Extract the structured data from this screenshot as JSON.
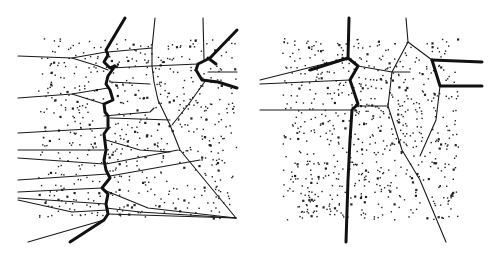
{
  "figure": {
    "width": 499,
    "height": 258,
    "background": "#ffffff",
    "ink_color": "#1a1a1a",
    "panels": [
      {
        "id": "left",
        "point_cloud": {
          "x": [
            38,
            236
          ],
          "y": [
            38,
            218
          ],
          "count": 620,
          "seed": 11
        },
        "bold_paths": [
          [
            [
              125,
              18
            ],
            [
              106,
              50
            ],
            [
              108,
              55
            ],
            [
              104,
              62
            ],
            [
              110,
              68
            ],
            [
              115,
              66
            ],
            [
              108,
              76
            ],
            [
              106,
              84
            ],
            [
              110,
              90
            ],
            [
              113,
              100
            ],
            [
              104,
              104
            ],
            [
              105,
              112
            ],
            [
              108,
              116
            ],
            [
              108,
              128
            ],
            [
              104,
              134
            ],
            [
              106,
              150
            ],
            [
              104,
              160
            ],
            [
              106,
              170
            ],
            [
              110,
              178
            ],
            [
              102,
              188
            ],
            [
              108,
              194
            ],
            [
              106,
              204
            ],
            [
              108,
              214
            ],
            [
              104,
              220
            ],
            [
              70,
              242
            ]
          ],
          [
            [
              237,
              30
            ],
            [
              210,
              58
            ],
            [
              198,
              64
            ],
            [
              196,
              70
            ],
            [
              202,
              80
            ],
            [
              218,
              82
            ],
            [
              237,
              88
            ]
          ],
          [
            [
              208,
              58
            ],
            [
              216,
              64
            ]
          ]
        ],
        "thin_paths": [
          [
            [
              18,
              56
            ],
            [
              72,
              58
            ],
            [
              106,
              52
            ]
          ],
          [
            [
              72,
              58
            ],
            [
              98,
              66
            ],
            [
              108,
              70
            ]
          ],
          [
            [
              108,
              52
            ],
            [
              152,
              48
            ]
          ],
          [
            [
              110,
              68
            ],
            [
              152,
              66
            ],
            [
              198,
              64
            ]
          ],
          [
            [
              155,
              18
            ],
            [
              152,
              48
            ],
            [
              152,
              66
            ],
            [
              154,
              82
            ],
            [
              158,
              100
            ],
            [
              170,
              125
            ],
            [
              180,
              150
            ],
            [
              236,
              218
            ]
          ],
          [
            [
              110,
              82
            ],
            [
              150,
              84
            ]
          ],
          [
            [
              18,
              98
            ],
            [
              72,
              94
            ],
            [
              108,
              88
            ]
          ],
          [
            [
              72,
              94
            ],
            [
              104,
              104
            ]
          ],
          [
            [
              104,
              116
            ],
            [
              150,
              112
            ],
            [
              154,
              108
            ]
          ],
          [
            [
              203,
              18
            ],
            [
              204,
              60
            ]
          ],
          [
            [
              206,
              80
            ],
            [
              188,
              105
            ],
            [
              172,
              125
            ]
          ],
          [
            [
              208,
              72
            ],
            [
              237,
              72
            ]
          ],
          [
            [
              18,
              133
            ],
            [
              106,
              128
            ]
          ],
          [
            [
              110,
              118
            ],
            [
              170,
              120
            ]
          ],
          [
            [
              106,
              140
            ],
            [
              140,
              150
            ],
            [
              170,
              152
            ]
          ],
          [
            [
              18,
              150
            ],
            [
              104,
              150
            ]
          ],
          [
            [
              18,
              158
            ],
            [
              104,
              164
            ]
          ],
          [
            [
              106,
              164
            ],
            [
              178,
              150
            ]
          ],
          [
            [
              18,
              180
            ],
            [
              108,
              174
            ]
          ],
          [
            [
              110,
              176
            ],
            [
              200,
              160
            ]
          ],
          [
            [
              18,
              192
            ],
            [
              102,
              188
            ]
          ],
          [
            [
              18,
              198
            ],
            [
              106,
              204
            ]
          ],
          [
            [
              104,
              190
            ],
            [
              148,
              208
            ],
            [
              236,
              218
            ]
          ],
          [
            [
              108,
              214
            ],
            [
              236,
              218
            ]
          ],
          [
            [
              106,
              208
            ],
            [
              140,
              212
            ],
            [
              236,
              218
            ]
          ],
          [
            [
              104,
              220
            ],
            [
              28,
              242
            ]
          ],
          [
            [
              108,
              210
            ],
            [
              72,
              212
            ],
            [
              18,
              200
            ]
          ]
        ]
      },
      {
        "id": "right",
        "point_cloud": {
          "x": [
            282,
            458
          ],
          "y": [
            38,
            220
          ],
          "count": 700,
          "seed": 29
        },
        "bold_paths": [
          [
            [
              349,
              18
            ],
            [
              348,
              58
            ],
            [
              358,
              66
            ],
            [
              350,
              80
            ],
            [
              358,
              104
            ],
            [
              352,
              110
            ],
            [
              350,
              140
            ],
            [
              348,
              180
            ],
            [
              346,
              242
            ]
          ],
          [
            [
              348,
              58
            ],
            [
              310,
              70
            ]
          ],
          [
            [
              432,
              60
            ],
            [
              440,
              86
            ],
            [
              482,
              86
            ]
          ],
          [
            [
              432,
              60
            ],
            [
              482,
              62
            ]
          ]
        ],
        "thin_paths": [
          [
            [
              260,
              80
            ],
            [
              348,
              58
            ]
          ],
          [
            [
              260,
              84
            ],
            [
              350,
              80
            ]
          ],
          [
            [
              260,
              110
            ],
            [
              352,
              110
            ]
          ],
          [
            [
              358,
              66
            ],
            [
              392,
              72
            ],
            [
              410,
              72
            ]
          ],
          [
            [
              406,
              18
            ],
            [
              408,
              42
            ],
            [
              392,
              72
            ],
            [
              388,
              106
            ],
            [
              402,
              150
            ],
            [
              420,
              180
            ],
            [
              446,
              242
            ]
          ],
          [
            [
              408,
              42
            ],
            [
              432,
              60
            ]
          ],
          [
            [
              440,
              86
            ],
            [
              436,
              120
            ],
            [
              420,
              156
            ]
          ],
          [
            [
              358,
              106
            ],
            [
              388,
              106
            ]
          ]
        ]
      }
    ]
  }
}
